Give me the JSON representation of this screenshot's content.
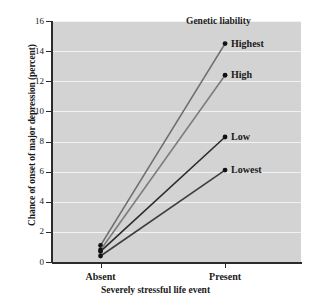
{
  "chart_data": {
    "type": "line",
    "title": "",
    "xlabel": "Severely stressful life event",
    "ylabel": "Chance of onset of major depression (percent)",
    "categories": [
      "Absent",
      "Present"
    ],
    "x": [
      0,
      1
    ],
    "ylim": [
      0,
      16
    ],
    "yticks": [
      0,
      2,
      4,
      6,
      8,
      10,
      12,
      14,
      16
    ],
    "ytick_labels": [
      "0",
      "2",
      "4",
      "6",
      "8",
      "10",
      "12",
      "14",
      "16"
    ],
    "grid": true,
    "legend_title": "Genetic liability",
    "legend_position": "inline-right-endpoint",
    "series": [
      {
        "name": "Highest",
        "values": [
          1.1,
          14.5
        ],
        "color": "#6e6e6e"
      },
      {
        "name": "High",
        "values": [
          0.8,
          12.4
        ],
        "color": "#7d7d7d"
      },
      {
        "name": "Low",
        "values": [
          0.7,
          8.3
        ],
        "color": "#2b2b2b"
      },
      {
        "name": "Lowest",
        "values": [
          0.4,
          6.1
        ],
        "color": "#3d3d3d"
      }
    ],
    "plot_background": "#d3d3d3",
    "gridline_color": "#f2f2f2",
    "axis_color": "#2b2b2b",
    "marker": "filled-circle"
  }
}
